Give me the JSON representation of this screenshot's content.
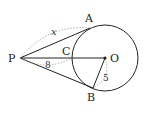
{
  "diagram": {
    "type": "geometry-tangent-circle",
    "points": {
      "P": {
        "label": "P",
        "x": 20,
        "y": 58
      },
      "A": {
        "label": "A",
        "x": 90,
        "y": 28
      },
      "B": {
        "label": "B",
        "x": 93,
        "y": 88
      },
      "C": {
        "label": "C",
        "x": 72,
        "y": 58
      },
      "O": {
        "label": "O",
        "x": 105,
        "y": 58
      }
    },
    "circle": {
      "center": "O",
      "radius": 33
    },
    "segments": [
      {
        "from": "P",
        "to": "A",
        "kind": "tangent"
      },
      {
        "from": "P",
        "to": "B",
        "kind": "tangent"
      },
      {
        "from": "P",
        "to": "O",
        "kind": "secant"
      },
      {
        "from": "O",
        "to": "B",
        "kind": "radius"
      }
    ],
    "measurements": {
      "PA": "x",
      "PC": "8",
      "OB": "5"
    },
    "colors": {
      "stroke": "#222222",
      "dotted": "#9a9a9a",
      "background": "#ffffff"
    }
  }
}
